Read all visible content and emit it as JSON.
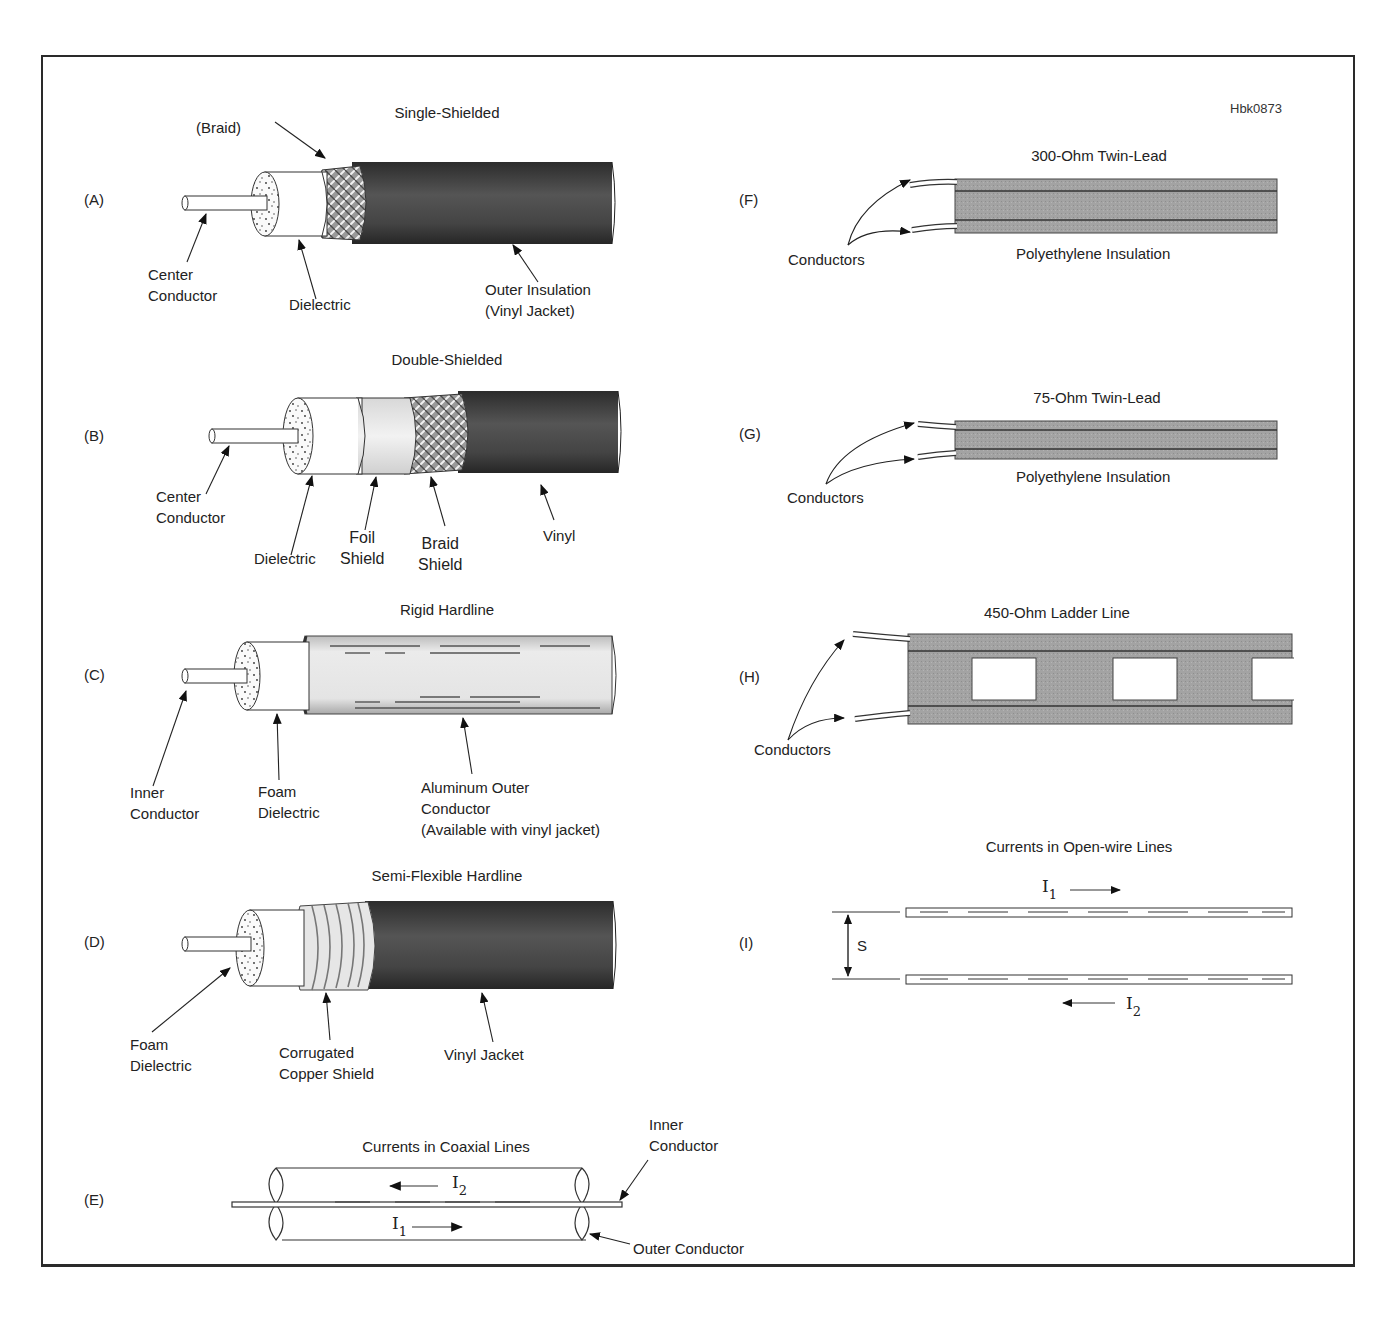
{
  "figure": {
    "reference_code": "Hbk0873",
    "colors": {
      "jacket_dark": "#3a3a3a",
      "braid": "#8a8a8a",
      "twinlead": "#9a9a9a",
      "aluminum": "#e8e8e8",
      "line": "#222222"
    }
  },
  "panels": {
    "A": {
      "letter": "(A)",
      "title": "Single-Shielded",
      "labels": {
        "braid": "(Braid)",
        "center": "Center\nConductor",
        "dielectric": "Dielectric",
        "outer": "Outer Insulation\n(Vinyl Jacket)"
      }
    },
    "B": {
      "letter": "(B)",
      "title": "Double-Shielded",
      "labels": {
        "center": "Center\nConductor",
        "dielectric": "Dielectric",
        "foil": "Foil\nShield",
        "braid": "Braid\nShield",
        "vinyl": "Vinyl"
      }
    },
    "C": {
      "letter": "(C)",
      "title": "Rigid Hardline",
      "labels": {
        "inner": "Inner\nConductor",
        "foam": "Foam\nDielectric",
        "outer": "Aluminum Outer\nConductor\n(Available with vinyl jacket)"
      }
    },
    "D": {
      "letter": "(D)",
      "title": "Semi-Flexible Hardline",
      "labels": {
        "foam": "Foam\nDielectric",
        "shield": "Corrugated\nCopper Shield",
        "jacket": "Vinyl Jacket"
      }
    },
    "E": {
      "letter": "(E)",
      "title": "Currents in Coaxial Lines",
      "labels": {
        "inner": "Inner\nConductor",
        "outer": "Outer Conductor"
      },
      "currents": {
        "i2": "I",
        "i2_sub": "2",
        "i1": "I",
        "i1_sub": "1"
      }
    },
    "F": {
      "letter": "(F)",
      "title": "300-Ohm Twin-Lead",
      "labels": {
        "conductors": "Conductors",
        "insulation": "Polyethylene Insulation"
      }
    },
    "G": {
      "letter": "(G)",
      "title": "75-Ohm Twin-Lead",
      "labels": {
        "conductors": "Conductors",
        "insulation": "Polyethylene Insulation"
      }
    },
    "H": {
      "letter": "(H)",
      "title": "450-Ohm Ladder Line",
      "labels": {
        "conductors": "Conductors"
      }
    },
    "I": {
      "letter": "(I)",
      "title": "Currents in Open-wire Lines",
      "labels": {
        "spacing": "S"
      },
      "currents": {
        "i1": "I",
        "i1_sub": "1",
        "i2": "I",
        "i2_sub": "2"
      }
    }
  }
}
